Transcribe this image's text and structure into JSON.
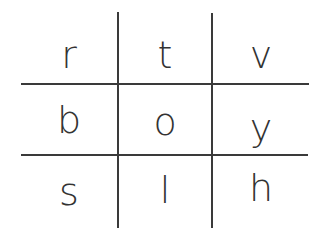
{
  "grid": {
    "rows": [
      [
        "r",
        "t",
        "v"
      ],
      [
        "b",
        "o",
        "y"
      ],
      [
        "s",
        "l",
        "h"
      ]
    ]
  },
  "colors": {
    "line": "#3a3a3a",
    "text": "#333333",
    "background": "#ffffff"
  }
}
